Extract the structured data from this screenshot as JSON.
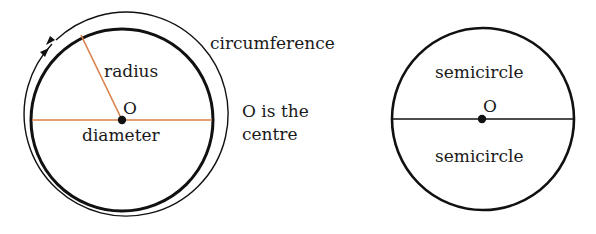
{
  "left_diagram": {
    "labels": {
      "radius": "radius",
      "centre_point": "O",
      "diameter": "diameter",
      "circumference": "circumference",
      "centre_note_line1": "O is the",
      "centre_note_line2": "centre"
    },
    "geometry": {
      "center": [
        122,
        120
      ],
      "circle_radius": 91,
      "circumference_arrow_radius": 102,
      "radius_end": [
        81,
        35
      ]
    }
  },
  "right_diagram": {
    "labels": {
      "top_half": "semicircle",
      "centre_point": "O",
      "bottom_half": "semicircle"
    },
    "geometry": {
      "center": [
        483,
        119
      ],
      "circle_radius": 91
    }
  },
  "colors": {
    "outline": "#111111",
    "radius_diameter_line": "#d9804a",
    "text": "#1a1a1a"
  }
}
